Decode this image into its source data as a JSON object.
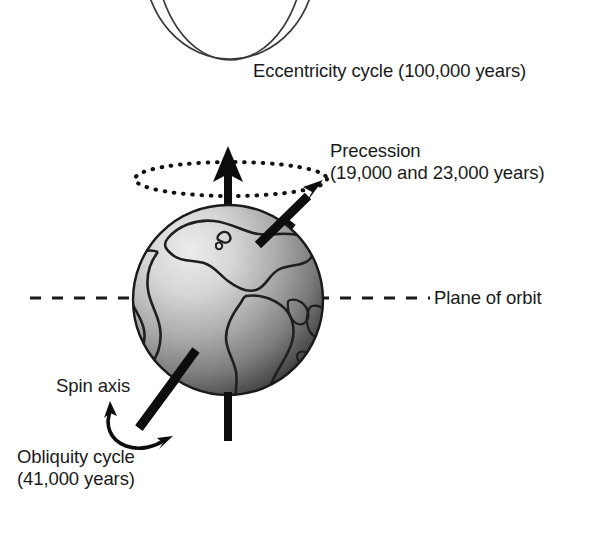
{
  "figure": {
    "background_color": "#ffffff",
    "ink_color": "#1a1a1a"
  },
  "labels": {
    "eccentricity": "Eccentricity cycle (100,000 years)",
    "precession_line1": "Precession",
    "precession_line2": "(19,000 and 23,000 years)",
    "plane_of_orbit": "Plane of orbit",
    "spin_axis": "Spin axis",
    "obliquity_line1": "Obliquity cycle",
    "obliquity_line2": "(41,000 years)"
  },
  "cycles": [
    {
      "name": "Eccentricity cycle",
      "period_years": "100,000",
      "label": "Eccentricity cycle (100,000 years)",
      "depiction": "two overlapping orbit curves (near-circular and elliptical) shown cropped at top of figure"
    },
    {
      "name": "Precession",
      "period_years": "19,000 and 23,000",
      "label": "Precession (19,000 and 23,000 years)",
      "depiction": "dotted ellipse traced by the spin axis around the vertical, with a thick arrow from the globe pointing up-right"
    },
    {
      "name": "Obliquity cycle",
      "period_years": "41,000",
      "label": "Obliquity cycle (41,000 years)",
      "depiction": "double-headed curved arrow at the lower end of the tilted spin axis"
    }
  ],
  "graphics": {
    "globe": {
      "name": "earth-globe",
      "center_x": 228,
      "center_y": 300,
      "radius": 95,
      "highlight_color": "#e2e2e2",
      "midtone_color": "#9a9a9a",
      "shadow_color": "#2e2e2e",
      "outline_color": "#1a1a1a"
    },
    "vertical_axis": {
      "name": "vertical-reference-axis",
      "x": 228,
      "top_y": 150,
      "bottom_y": 441,
      "width": 8,
      "color": "#0d0d0d",
      "arrow_head": "up"
    },
    "spin_axis": {
      "name": "tilted-spin-axis",
      "from_x": 285,
      "from_y": 232,
      "to_x": 139,
      "to_y": 428,
      "width": 9,
      "color": "#0d0d0d"
    },
    "precession_arrow": {
      "name": "precession-arrow",
      "from_x": 262,
      "from_y": 240,
      "to_x": 322,
      "to_y": 182,
      "width": 9,
      "color": "#0d0d0d"
    },
    "precession_ellipse": {
      "name": "precession-dotted-ellipse",
      "center_x": 231,
      "center_y": 179,
      "radius_x": 96,
      "radius_y": 17,
      "style": "dotted",
      "color": "#111111"
    },
    "orbit_plane_line": {
      "name": "orbit-plane-dashed-line",
      "y": 298,
      "left_start_x": 30,
      "left_end_x": 140,
      "right_start_x": 320,
      "right_end_x": 430,
      "style": "dashed",
      "color": "#1a1a1a"
    },
    "obliquity_arc": {
      "name": "obliquity-double-arrow",
      "color": "#0d0d0d",
      "arrow_heads": "both"
    },
    "orbit_curves": {
      "name": "eccentricity-orbit-curves",
      "color": "#3a3a3a",
      "count": 2,
      "note": "cropped at the top edge of the image"
    }
  }
}
